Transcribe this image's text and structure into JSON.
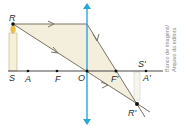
{
  "diagram": {
    "type": "converging-lens-ray-diagram",
    "points": {
      "R": "R",
      "S": "S",
      "A": "A",
      "F": "F",
      "O": "O",
      "F_prime": "F'",
      "S_prime": "S'",
      "A_prime": "A'",
      "R_prime": "R'"
    },
    "colors": {
      "lens": "#2aa6dc",
      "axis": "#333333",
      "rays": "#7a7262",
      "shade": "#f3efdc",
      "candle": "#f6f0d6"
    }
  },
  "credit": {
    "line1": "Banco de imagens/",
    "line2": "Arquivo da editora"
  }
}
